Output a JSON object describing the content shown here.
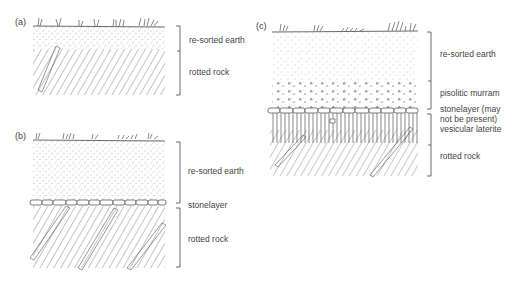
{
  "panels": [
    {
      "id": "a",
      "label": "(a)",
      "layers": [
        {
          "name": "re-sorted earth"
        },
        {
          "name": "rotted rock"
        }
      ]
    },
    {
      "id": "b",
      "label": "(b)",
      "layers": [
        {
          "name": "re-sorted earth"
        },
        {
          "name": "stonelayer"
        },
        {
          "name": "rotted rock"
        }
      ]
    },
    {
      "id": "c",
      "label": "(c)",
      "layers": [
        {
          "name": "re-sorted earth"
        },
        {
          "name": "pisolitic murram"
        },
        {
          "name": "stonelayer (may"
        },
        {
          "name": "not be present)"
        },
        {
          "name": "vesicular laterite"
        },
        {
          "name": "rotted rock"
        }
      ]
    }
  ]
}
